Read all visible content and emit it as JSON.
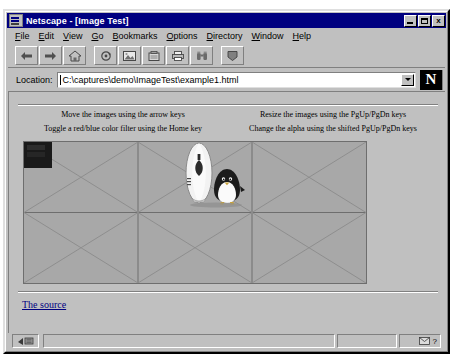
{
  "window": {
    "title": "Netscape - [Image Test]",
    "icon": "netscape-window-icon",
    "buttons": {
      "minimize": "_",
      "maximize": "□",
      "close": "x"
    }
  },
  "menubar": {
    "items": [
      {
        "label": "File",
        "mnemonic": "F"
      },
      {
        "label": "Edit",
        "mnemonic": "E"
      },
      {
        "label": "View",
        "mnemonic": "V"
      },
      {
        "label": "Go",
        "mnemonic": "G"
      },
      {
        "label": "Bookmarks",
        "mnemonic": "B"
      },
      {
        "label": "Options",
        "mnemonic": "O"
      },
      {
        "label": "Directory",
        "mnemonic": "D"
      },
      {
        "label": "Window",
        "mnemonic": "W"
      },
      {
        "label": "Help",
        "mnemonic": "H"
      }
    ]
  },
  "toolbar": {
    "buttons": [
      {
        "name": "back-button",
        "icon": "back-arrow-icon",
        "label": "Back"
      },
      {
        "name": "forward-button",
        "icon": "forward-arrow-icon",
        "label": "Forward"
      },
      {
        "name": "home-button",
        "icon": "home-icon",
        "label": "Home"
      },
      {
        "name": "reload-button",
        "icon": "reload-icon",
        "label": "Reload"
      },
      {
        "name": "images-button",
        "icon": "images-icon",
        "label": "Images"
      },
      {
        "name": "open-button",
        "icon": "open-icon",
        "label": "Open"
      },
      {
        "name": "print-button",
        "icon": "print-icon",
        "label": "Print"
      },
      {
        "name": "find-button",
        "icon": "find-binoculars-icon",
        "label": "Find"
      },
      {
        "name": "stop-button",
        "icon": "stop-icon",
        "label": "Stop"
      }
    ]
  },
  "location": {
    "label": "Location:",
    "value": "C:\\captures\\demo\\ImageTest\\example1.html",
    "placeholder": "",
    "dropdown_icon": "chevron-down-icon",
    "brand_logo": "N"
  },
  "page": {
    "instructions": [
      {
        "left": "Move the images using the arrow keys",
        "right": "Resize the images using the PgUp/PgDn keys"
      },
      {
        "left": "Toggle a red/blue color filter using the Home key",
        "right": "Change the alpha using the shifted PgUp/PgDn keys"
      }
    ],
    "applet": {
      "name": "image-test-applet",
      "background_color": "#a8a8a8",
      "grid_line_color": "#6e6e6e",
      "grid_columns": 3,
      "grid_rows": 2,
      "dark_patch_color": "#1a1a1a",
      "sprites": [
        "surfboard",
        "penguin"
      ]
    },
    "source_link": "The source"
  },
  "statusbar": {
    "security_icon": "broken-key-icon",
    "message": "",
    "mail_icon": "mail-icon",
    "help_icon": "question-mark-icon",
    "help_label": "?"
  }
}
